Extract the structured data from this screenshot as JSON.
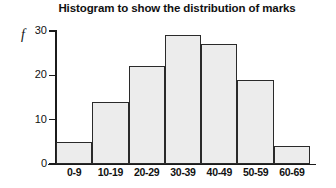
{
  "chart_data": {
    "type": "bar",
    "title": "Histogram to show the distribution of marks",
    "xlabel": "",
    "ylabel": "f",
    "categories": [
      "0-9",
      "10-19",
      "20-29",
      "30-39",
      "40-49",
      "50-59",
      "60-69"
    ],
    "values": [
      5,
      14,
      22,
      29,
      27,
      19,
      4
    ],
    "ylim": [
      0,
      30
    ],
    "yticks": [
      "0",
      "10",
      "20",
      "30"
    ],
    "ytick_values": [
      0,
      10,
      20,
      30
    ],
    "grid": false,
    "legend": null,
    "bar_fill_color": "#ececec",
    "bar_edge_color": "#2a2a2a",
    "axis_color": "#1b1b1b",
    "text_color": "#111111",
    "background_color": "#ffffff"
  }
}
